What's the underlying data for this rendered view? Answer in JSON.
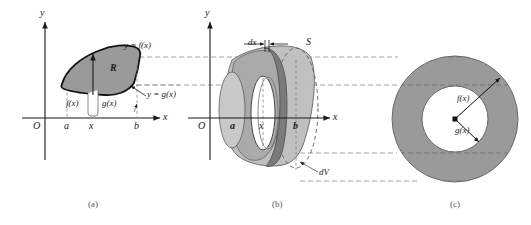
{
  "figure": {
    "colors": {
      "region_fill": "#9a9a9a",
      "solid_fill_light": "#c8c8c8",
      "solid_fill_mid": "#a8a8a8",
      "solid_fill_dark": "#8f8f8f",
      "band_dark": "#7b7b7b",
      "annulus_fill": "#9a9a9a",
      "hole_fill": "#ffffff",
      "stroke": "#1a1a1a",
      "dashed": "#8d8d8d",
      "thin": "#555555"
    },
    "connector_lines": [
      57,
      85,
      153,
      181
    ]
  },
  "panel_a": {
    "caption": "(a)",
    "axis_y_label": "y",
    "axis_x_label": "x",
    "origin_label": "O",
    "tick_a": "a",
    "tick_x": "x",
    "tick_b": "b",
    "region_label": "R",
    "curve_upper_label": "y = f(x)",
    "curve_lower_label": "y = g(x)",
    "height_upper_label": "f(x)",
    "height_lower_label": "g(x)"
  },
  "panel_b": {
    "caption": "(b)",
    "axis_y_label": "y",
    "axis_x_label": "x",
    "origin_label": "O",
    "tick_a": "a",
    "tick_x": "x",
    "tick_b": "b",
    "thickness_label": "dx",
    "surface_label": "S",
    "volume_label": "dV"
  },
  "panel_c": {
    "caption": "(c)",
    "outer_radius_label": "f(x)",
    "inner_radius_label": "g(x)"
  }
}
